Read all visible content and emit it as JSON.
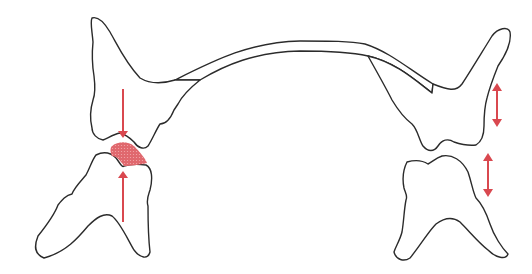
{
  "diagram": {
    "title": "",
    "colors": {
      "outline": "#2b2b2b",
      "accent": "#d9484f",
      "contact_fill": "#e0686e",
      "background": "#ffffff"
    },
    "elements": [
      {
        "id": "upper-left-tooth",
        "label": ""
      },
      {
        "id": "lower-left-tooth",
        "label": ""
      },
      {
        "id": "upper-right-tooth",
        "label": ""
      },
      {
        "id": "lower-right-tooth",
        "label": ""
      },
      {
        "id": "connecting-arch",
        "label": ""
      },
      {
        "id": "contact-point",
        "label": ""
      },
      {
        "id": "force-arrow-down",
        "label": ""
      },
      {
        "id": "force-arrow-up",
        "label": ""
      },
      {
        "id": "movement-arrow-upper-right",
        "label": ""
      },
      {
        "id": "movement-arrow-lower-right",
        "label": ""
      }
    ]
  }
}
